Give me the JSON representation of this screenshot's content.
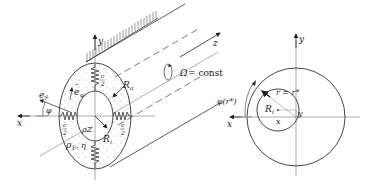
{
  "left_figure": {
    "labels": {
      "y_axis": "y",
      "x_axis": "x",
      "z_axis": "z",
      "e_r": "e⃗ᵣ",
      "e_r_text": "e",
      "e_r_sub": "r",
      "e_phi_text": "e",
      "e_phi_sub": "φ",
      "phi": "φ",
      "R_a": "R",
      "R_a_sub": "a",
      "R_i": "R",
      "R_i_sub": "i",
      "rho_z": "ρZ",
      "rho_F_eta": "ρ",
      "rho_F_sub": "F",
      "eta": ", η",
      "spring_top_frac_num": "c",
      "spring_top_frac_den": "2",
      "spring_left_frac_num": "c",
      "spring_left_frac_den": "2",
      "spring_right_frac_num": "c",
      "spring_right_frac_den": "2",
      "omega": "Ω",
      "omega_rest": " = const"
    }
  },
  "right_figure": {
    "labels": {
      "y_axis": "y",
      "x_axis": "x",
      "phi_r": "φ(r*)",
      "r_eq": "r = r*",
      "R_i": "R",
      "R_i_sub": "i",
      "x_small": "x",
      "y_small": "y"
    }
  }
}
